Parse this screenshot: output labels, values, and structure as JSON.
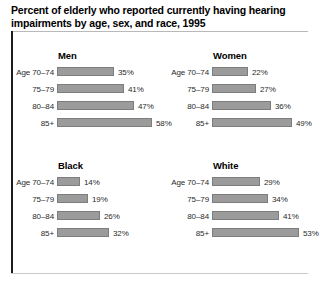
{
  "title": {
    "line1": "Percent of elderly who reported currently having hearing",
    "line2": "impairments by age, sex, and race, 1995"
  },
  "style": {
    "bar_fill": "#9b9b9b",
    "bar_stroke": "#7d7d7d",
    "rule_color": "#1c1c1c",
    "text_color": "#2a2a2a"
  },
  "chart_data": {
    "type": "bar",
    "title": "Percent of elderly who reported currently having hearing impairments by age, sex, and race, 1995",
    "xlabel": "",
    "ylabel": "",
    "unit": "%",
    "xlim": [
      0,
      60
    ],
    "grid": false,
    "legend": "none",
    "orientation": "horizontal",
    "categories": [
      "Age 70–74",
      "75–79",
      "80–84",
      "85+"
    ],
    "panels": [
      {
        "name": "Men",
        "position": "top-left",
        "rows": [
          {
            "category": "Age 70–74",
            "value": 35,
            "label": "35%"
          },
          {
            "category": "75–79",
            "value": 41,
            "label": "41%"
          },
          {
            "category": "80–84",
            "value": 47,
            "label": "47%"
          },
          {
            "category": "85+",
            "value": 58,
            "label": "58%"
          }
        ]
      },
      {
        "name": "Women",
        "position": "top-right",
        "rows": [
          {
            "category": "Age 70–74",
            "value": 22,
            "label": "22%"
          },
          {
            "category": "75–79",
            "value": 27,
            "label": "27%"
          },
          {
            "category": "80–84",
            "value": 36,
            "label": "36%"
          },
          {
            "category": "85+",
            "value": 49,
            "label": "49%"
          }
        ]
      },
      {
        "name": "Black",
        "position": "bottom-left",
        "rows": [
          {
            "category": "Age 70–74",
            "value": 14,
            "label": "14%"
          },
          {
            "category": "75–79",
            "value": 19,
            "label": "19%"
          },
          {
            "category": "80–84",
            "value": 26,
            "label": "26%"
          },
          {
            "category": "85+",
            "value": 32,
            "label": "32%"
          }
        ]
      },
      {
        "name": "White",
        "position": "bottom-right",
        "rows": [
          {
            "category": "Age 70–74",
            "value": 29,
            "label": "29%"
          },
          {
            "category": "75–79",
            "value": 34,
            "label": "34%"
          },
          {
            "category": "80–84",
            "value": 41,
            "label": "41%"
          },
          {
            "category": "85+",
            "value": 53,
            "label": "53%"
          }
        ]
      }
    ]
  }
}
